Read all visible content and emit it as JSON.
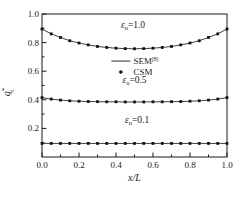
{
  "figure": {
    "background": "#ffffff",
    "axis_color": "#1a1a1a",
    "line_color": "#2a2a2a",
    "marker_color": "#111111",
    "plot_box_px": {
      "left": 42,
      "top": 14,
      "right": 227,
      "bottom": 157
    },
    "xlabel": "x/L",
    "ylabel": {
      "base": "q",
      "sub": "t",
      "sup": "*"
    },
    "x_tick_labels": [
      "0.0",
      "0.2",
      "0.4",
      "0.6",
      "0.8",
      "1.0"
    ],
    "x_major_ticks": [
      0.0,
      0.2,
      0.4,
      0.6,
      0.8,
      1.0
    ],
    "x_minor_ticks": [
      0.1,
      0.3,
      0.5,
      0.7,
      0.9
    ],
    "y_tick_labels": [
      "0.2",
      "0.4",
      "0.6",
      "0.8",
      "1.0"
    ],
    "y_major_ticks": [
      0.2,
      0.4,
      0.6,
      0.8,
      1.0
    ],
    "y_minor_ticks": [
      0.1,
      0.3,
      0.5,
      0.7,
      0.9
    ]
  },
  "legend": {
    "x_frac": 0.375,
    "rows": [
      {
        "type": "line",
        "label": "SEM",
        "sup": "[8]",
        "y_frac": 0.671
      },
      {
        "type": "dot",
        "label": "CSM",
        "sup": "",
        "y_frac": 0.594
      }
    ]
  },
  "annotations": [
    {
      "base": "ε",
      "sub": "u",
      "rest": "=1.0",
      "ax": 0.492,
      "ay": 0.902
    },
    {
      "base": "ε",
      "sub": "u",
      "rest": "=0.5",
      "ax": 0.5,
      "ay": 0.517
    },
    {
      "base": "ε",
      "sub": "u",
      "rest": "=0.1",
      "ax": 0.514,
      "ay": 0.238
    }
  ],
  "chart_data": {
    "type": "line",
    "title": "",
    "xlabel": "x/L",
    "ylabel": "q_t^*",
    "xlim": [
      0,
      1
    ],
    "ylim": [
      0,
      1
    ],
    "legend_entries": [
      "SEM[8] (line)",
      "CSM (points)"
    ],
    "x": [
      0,
      0.05,
      0.1,
      0.15,
      0.2,
      0.25,
      0.3,
      0.35,
      0.4,
      0.45,
      0.5,
      0.55,
      0.6,
      0.65,
      0.7,
      0.75,
      0.8,
      0.85,
      0.9,
      0.95,
      1.0
    ],
    "groups": [
      {
        "name": "eps_u=1.0",
        "values": [
          0.895,
          0.861,
          0.836,
          0.813,
          0.797,
          0.784,
          0.773,
          0.766,
          0.761,
          0.758,
          0.757,
          0.758,
          0.761,
          0.766,
          0.773,
          0.784,
          0.797,
          0.813,
          0.836,
          0.861,
          0.895
        ]
      },
      {
        "name": "eps_u=0.5",
        "values": [
          0.415,
          0.405,
          0.398,
          0.393,
          0.39,
          0.388,
          0.387,
          0.386,
          0.386,
          0.385,
          0.385,
          0.385,
          0.386,
          0.386,
          0.387,
          0.388,
          0.39,
          0.393,
          0.398,
          0.405,
          0.415
        ]
      },
      {
        "name": "eps_u=0.1",
        "values": [
          0.095,
          0.095,
          0.095,
          0.095,
          0.095,
          0.095,
          0.095,
          0.095,
          0.095,
          0.095,
          0.095,
          0.095,
          0.095,
          0.095,
          0.095,
          0.095,
          0.095,
          0.095,
          0.095,
          0.095,
          0.095
        ]
      }
    ]
  }
}
